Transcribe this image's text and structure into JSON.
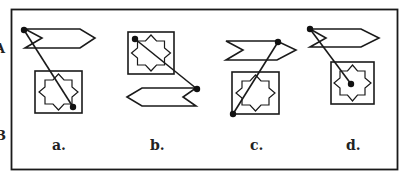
{
  "edge_fragments": [
    {
      "text": "A",
      "x": 0,
      "y": 53
    },
    {
      "text": "B",
      "x": 0,
      "y": 140
    }
  ],
  "options": [
    {
      "id": "a",
      "label": "a.",
      "label_x": 52,
      "label_y": 150
    },
    {
      "id": "b",
      "label": "b.",
      "label_x": 150,
      "label_y": 150
    },
    {
      "id": "c",
      "label": "c.",
      "label_x": 250,
      "label_y": 150
    },
    {
      "id": "d",
      "label": "d.",
      "label_x": 346,
      "label_y": 150
    }
  ],
  "colors": {
    "line": "#1a1a1a",
    "background": "#ffffff"
  }
}
